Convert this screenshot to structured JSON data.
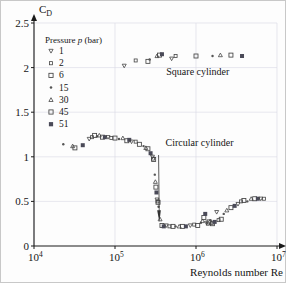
{
  "figure": {
    "background": "#fdfdfd",
    "border_color": "#c8c8c8"
  },
  "axes": {
    "y_axis_title": "C",
    "y_axis_title_sub": "D",
    "x_axis_title": "Reynolds number Re",
    "y_ticks": [
      "0",
      "0.5",
      "1",
      "1.5",
      "2",
      "2.5"
    ],
    "x_tick_mantissas": [
      "10",
      "10",
      "10",
      "10"
    ],
    "x_tick_exponents": [
      "4",
      "5",
      "6",
      "7"
    ]
  },
  "legend": {
    "title": "Pressure p (bar)",
    "title_plain": "Pressure",
    "title_italic": "p",
    "title_unit": "(bar)",
    "items": [
      {
        "label": "1",
        "marker": "triangle-down"
      },
      {
        "label": "2",
        "marker": "square-small"
      },
      {
        "label": "6",
        "marker": "square"
      },
      {
        "label": "15",
        "marker": "dot"
      },
      {
        "label": "30",
        "marker": "triangle-up"
      },
      {
        "label": "45",
        "marker": "square-open"
      },
      {
        "label": "51",
        "marker": "square-filled"
      }
    ]
  },
  "annotations": [
    {
      "name": "square-cylinder-label",
      "text": "Square cylinder"
    },
    {
      "name": "circular-cylinder-label",
      "text": "Circular cylinder"
    }
  ],
  "chart_data": {
    "type": "scatter",
    "title": "",
    "xlabel": "Reynolds number Re",
    "ylabel": "C_D",
    "xscale": "log",
    "xlim": [
      10000,
      10000000
    ],
    "ylim": [
      0,
      2.5
    ],
    "grid": true,
    "legend_position": "upper-left",
    "series": [
      {
        "name": "Square cylinder",
        "points": [
          {
            "x": 130000,
            "y": 2.02
          },
          {
            "x": 180000,
            "y": 2.08
          },
          {
            "x": 255000,
            "y": 2.07
          },
          {
            "x": 268000,
            "y": 2.09
          },
          {
            "x": 330000,
            "y": 2.13
          },
          {
            "x": 355000,
            "y": 2.14
          },
          {
            "x": 380000,
            "y": 2.15
          },
          {
            "x": 500000,
            "y": 2.1
          },
          {
            "x": 560000,
            "y": 2.13
          },
          {
            "x": 1000000,
            "y": 2.13
          },
          {
            "x": 1600000,
            "y": 2.13
          },
          {
            "x": 2000000,
            "y": 2.14
          },
          {
            "x": 2700000,
            "y": 2.14
          },
          {
            "x": 3700000,
            "y": 2.13
          }
        ]
      },
      {
        "name": "Circular cylinder",
        "points": [
          {
            "x": 23000,
            "y": 1.14
          },
          {
            "x": 30000,
            "y": 1.12
          },
          {
            "x": 32000,
            "y": 1.1
          },
          {
            "x": 40000,
            "y": 1.13
          },
          {
            "x": 48000,
            "y": 1.2
          },
          {
            "x": 52000,
            "y": 1.22
          },
          {
            "x": 56000,
            "y": 1.24
          },
          {
            "x": 60000,
            "y": 1.23
          },
          {
            "x": 64000,
            "y": 1.24
          },
          {
            "x": 70000,
            "y": 1.22
          },
          {
            "x": 75000,
            "y": 1.22
          },
          {
            "x": 82000,
            "y": 1.22
          },
          {
            "x": 90000,
            "y": 1.21
          },
          {
            "x": 100000,
            "y": 1.21
          },
          {
            "x": 112000,
            "y": 1.2
          },
          {
            "x": 125000,
            "y": 1.21
          },
          {
            "x": 140000,
            "y": 1.18
          },
          {
            "x": 150000,
            "y": 1.19
          },
          {
            "x": 160000,
            "y": 1.17
          },
          {
            "x": 180000,
            "y": 1.17
          },
          {
            "x": 200000,
            "y": 1.14
          },
          {
            "x": 225000,
            "y": 1.12
          },
          {
            "x": 240000,
            "y": 1.1
          },
          {
            "x": 255000,
            "y": 1.09
          },
          {
            "x": 275000,
            "y": 1.04
          },
          {
            "x": 290000,
            "y": 1.0
          },
          {
            "x": 295000,
            "y": 0.98
          },
          {
            "x": 300000,
            "y": 0.97
          },
          {
            "x": 310000,
            "y": 0.8
          },
          {
            "x": 315000,
            "y": 0.72
          },
          {
            "x": 320000,
            "y": 0.66
          },
          {
            "x": 325000,
            "y": 0.6
          },
          {
            "x": 330000,
            "y": 0.52
          },
          {
            "x": 335000,
            "y": 0.5
          },
          {
            "x": 340000,
            "y": 0.49
          },
          {
            "x": 345000,
            "y": 0.44
          },
          {
            "x": 360000,
            "y": 0.3
          },
          {
            "x": 380000,
            "y": 0.23
          },
          {
            "x": 400000,
            "y": 0.22
          },
          {
            "x": 430000,
            "y": 0.23
          },
          {
            "x": 470000,
            "y": 0.22
          },
          {
            "x": 520000,
            "y": 0.22
          },
          {
            "x": 560000,
            "y": 0.22
          },
          {
            "x": 620000,
            "y": 0.22
          },
          {
            "x": 680000,
            "y": 0.22
          },
          {
            "x": 750000,
            "y": 0.22
          },
          {
            "x": 850000,
            "y": 0.23
          },
          {
            "x": 950000,
            "y": 0.24
          },
          {
            "x": 1050000,
            "y": 0.23
          },
          {
            "x": 1150000,
            "y": 0.26
          },
          {
            "x": 1200000,
            "y": 0.28
          },
          {
            "x": 1250000,
            "y": 0.32
          },
          {
            "x": 1300000,
            "y": 0.36
          },
          {
            "x": 1350000,
            "y": 0.26
          },
          {
            "x": 1400000,
            "y": 0.25
          },
          {
            "x": 1450000,
            "y": 0.27
          },
          {
            "x": 1500000,
            "y": 0.29
          },
          {
            "x": 1550000,
            "y": 0.26
          },
          {
            "x": 1600000,
            "y": 0.25
          },
          {
            "x": 1700000,
            "y": 0.27
          },
          {
            "x": 1800000,
            "y": 0.38
          },
          {
            "x": 1900000,
            "y": 0.29
          },
          {
            "x": 2050000,
            "y": 0.3
          },
          {
            "x": 2200000,
            "y": 0.36
          },
          {
            "x": 2400000,
            "y": 0.4
          },
          {
            "x": 2700000,
            "y": 0.43
          },
          {
            "x": 3000000,
            "y": 0.45
          },
          {
            "x": 3300000,
            "y": 0.47
          },
          {
            "x": 3600000,
            "y": 0.5
          },
          {
            "x": 3900000,
            "y": 0.51
          },
          {
            "x": 4300000,
            "y": 0.5
          },
          {
            "x": 4800000,
            "y": 0.53
          },
          {
            "x": 5300000,
            "y": 0.53
          },
          {
            "x": 5800000,
            "y": 0.53
          },
          {
            "x": 6300000,
            "y": 0.53
          },
          {
            "x": 6900000,
            "y": 0.53
          }
        ]
      }
    ]
  }
}
